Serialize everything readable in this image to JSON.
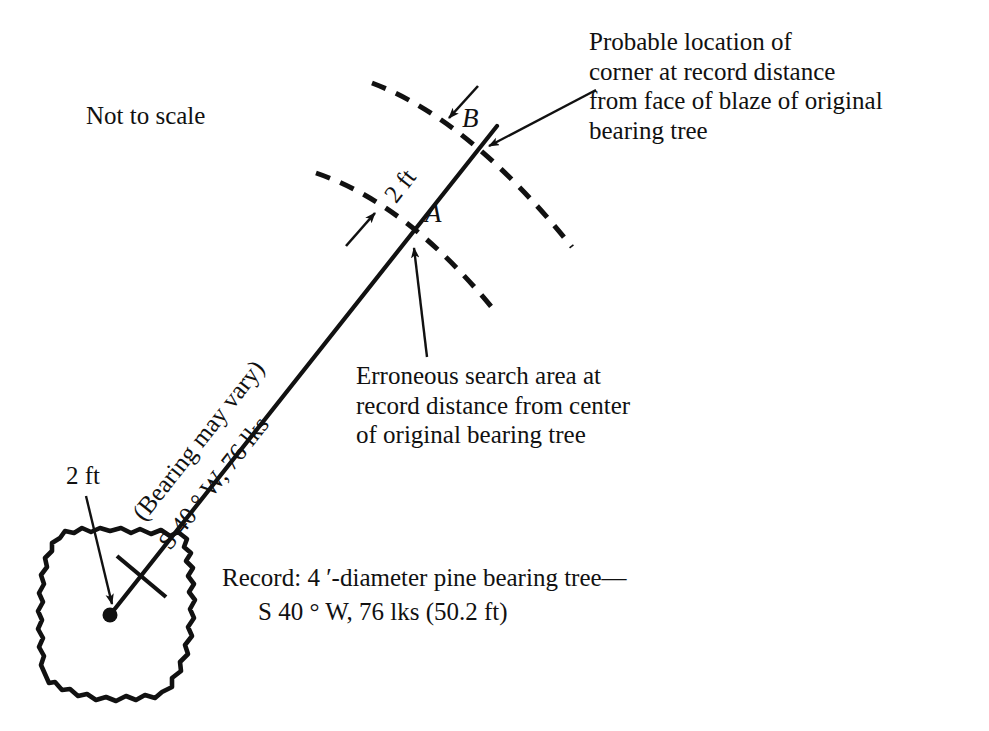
{
  "figure": {
    "scale_note": "Not to scale",
    "labels": {
      "point_a": "A",
      "point_b": "B",
      "arc_gap": "2 ft",
      "tree_radius": "2 ft"
    },
    "annotations": {
      "probable_location": "Probable location of\ncorner at record distance\nfrom face of blaze of original\nbearing tree",
      "erroneous_area": "Erroneous search area at\nrecord distance from center\nof original bearing tree",
      "record_line1": "Record: 4 ′-diameter pine bearing tree—",
      "record_line2": "S 40 ° W, 76 lks (50.2 ft)"
    },
    "bearing_line": {
      "line1": "(Bearing may vary)",
      "line2": "S 40 ° W, 76 lks"
    },
    "colors": {
      "ink": "#111111",
      "background": "#ffffff"
    },
    "geometry": {
      "point_a": [
        411,
        233
      ],
      "point_b": [
        478,
        150
      ],
      "tree_center": [
        110,
        615
      ],
      "arc_dash": "14 10"
    }
  }
}
